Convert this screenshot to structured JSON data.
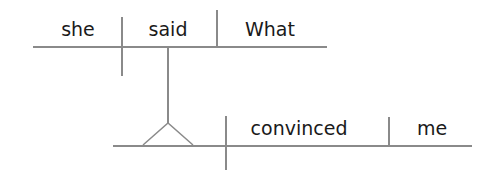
{
  "diagram": {
    "type": "sentence-diagram",
    "main_clause": {
      "subject": "she",
      "verb": "said",
      "object": "What"
    },
    "noun_clause": {
      "subject": "",
      "verb": "convinced",
      "object": "me"
    },
    "colors": {
      "line": "#8a8a8a",
      "text": "#1a1a1a",
      "background": "#ffffff"
    }
  }
}
